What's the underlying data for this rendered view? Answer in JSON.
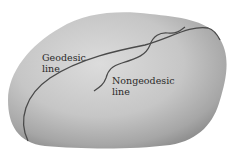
{
  "diagram": {
    "labels": {
      "geodesic": "Geodesic\nline",
      "nongeodesic": "Nongeodesic\nline"
    },
    "colors": {
      "surface_light": "#d9d9d9",
      "surface_dark": "#8e8e8e",
      "line": "#4a4a4a",
      "text": "#2a2a2a",
      "background": "#ffffff"
    }
  }
}
